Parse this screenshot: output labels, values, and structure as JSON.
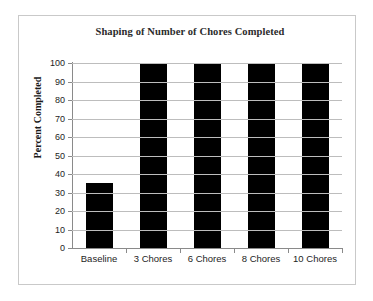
{
  "chart_data": {
    "type": "bar",
    "title": "Shaping of Number of Chores Completed",
    "xlabel": "",
    "ylabel": "Percent Completed",
    "categories": [
      "Baseline",
      "3 Chores",
      "6 Chores",
      "8 Chores",
      "10 Chores"
    ],
    "values": [
      35,
      100,
      100,
      100,
      100
    ],
    "ylim": [
      0,
      100
    ],
    "ytick_labels": [
      "0",
      "10",
      "20",
      "30",
      "40",
      "50",
      "60",
      "70",
      "80",
      "90",
      "100"
    ],
    "ytick_values": [
      0,
      10,
      20,
      30,
      40,
      50,
      60,
      70,
      80,
      90,
      100
    ],
    "grid": true,
    "legend": false,
    "legend_position": "none",
    "bar_color": "#000000",
    "gridline_color": "#bdbdbd",
    "axis_color": "#8a8a8a",
    "background_color": "#ffffff",
    "border_color": "#c9c9c9"
  }
}
